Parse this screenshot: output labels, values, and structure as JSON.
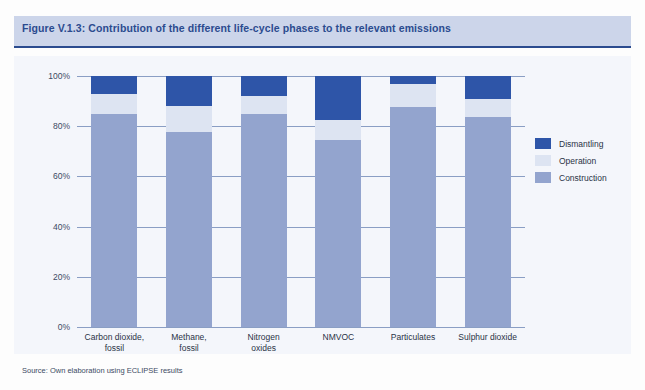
{
  "figure": {
    "title": "Figure V.1.3: Contribution of the different life-cycle phases to the relevant emissions",
    "source_note": "Source: Own elaboration using ECLIPSE results"
  },
  "colors": {
    "dismantling": "#2e55a8",
    "operation": "#dde4f2",
    "construction": "#93a4ce",
    "title_band": "#ccd5ea",
    "title_text": "#2b4b8f",
    "plate": "#f4f6fb",
    "gridline": "#8a9ec4"
  },
  "legend": {
    "position": "right",
    "items": [
      {
        "label": "Dismantling",
        "color": "#2e55a8"
      },
      {
        "label": "Operation",
        "color": "#dde4f2"
      },
      {
        "label": "Construction",
        "color": "#93a4ce"
      }
    ]
  },
  "axis": {
    "y_ticks": [
      "0%",
      "20%",
      "40%",
      "60%",
      "80%",
      "100%"
    ],
    "y_tick_values": [
      0,
      20,
      40,
      60,
      80,
      100
    ]
  },
  "chart_data": {
    "type": "bar",
    "stacked": true,
    "stack_mode": "percent",
    "title": "Figure V.1.3: Contribution of the different life-cycle phases to the relevant emissions",
    "xlabel": "",
    "ylabel": "",
    "ylim": [
      0,
      100
    ],
    "ytick_labels": [
      "0%",
      "20%",
      "40%",
      "60%",
      "80%",
      "100%"
    ],
    "grid": true,
    "legend_position": "right",
    "categories": [
      "Carbon dioxide, fossil",
      "Methane, fossil",
      "Nitrogen oxides",
      "NMVOC",
      "Particulates",
      "Sulphur dioxide"
    ],
    "series": [
      {
        "name": "Construction",
        "color": "#93a4ce",
        "values": [
          85.0,
          77.5,
          85.0,
          74.5,
          87.5,
          83.5
        ]
      },
      {
        "name": "Operation",
        "color": "#dde4f2",
        "values": [
          8.0,
          10.5,
          7.0,
          8.0,
          9.5,
          7.5
        ]
      },
      {
        "name": "Dismantling",
        "color": "#2e55a8",
        "values": [
          7.0,
          12.0,
          8.0,
          17.5,
          3.0,
          9.0
        ]
      }
    ]
  }
}
